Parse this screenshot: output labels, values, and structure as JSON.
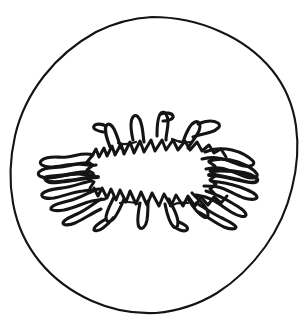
{
  "figure": {
    "caption": "",
    "background_color": "#ffffff",
    "ink_color": "#141414",
    "canvas": {
      "width": 306,
      "height": 330
    },
    "elements": {
      "outer_boundary": {
        "label": "outer circular outline",
        "shape": "irregular hand-drawn circle",
        "center": [
          154,
          165
        ],
        "radius_x": 143,
        "radius_y": 148,
        "bounds": [
          11,
          17,
          297,
          313
        ],
        "stroke_width": 2.1,
        "stroke_color": "#141414"
      },
      "central_body": {
        "label": "central radiating serrated structure",
        "shape": "sunburst ellipse with sawtooth margin and radiating tendrils",
        "center": [
          150,
          172
        ],
        "bounds": [
          46,
          114,
          252,
          232
        ],
        "core": {
          "label": "white elliptical core",
          "center": [
            150,
            172
          ],
          "radius_x": 57,
          "radius_y": 30,
          "fill": "#ffffff"
        },
        "serration_count": 34,
        "stroke_width": 3.0,
        "stroke_color": "#141414"
      },
      "rays": {
        "label": "radiating zigzag tendrils",
        "count": 12,
        "left_cluster_extent_x": 46,
        "right_cluster_extent_x": 252,
        "stroke_width": 3.1
      }
    },
    "text_labels": []
  }
}
